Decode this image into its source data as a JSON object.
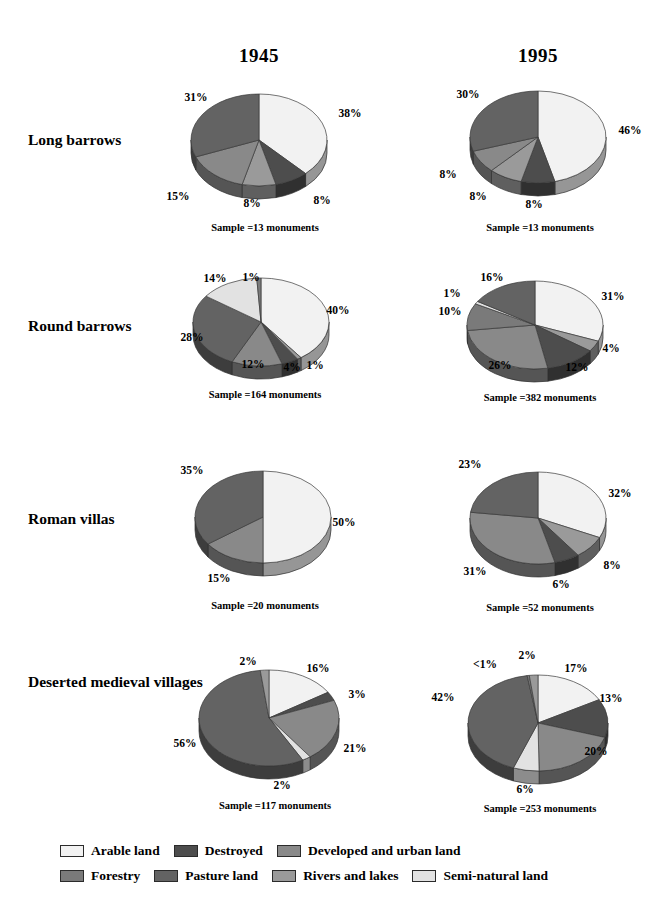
{
  "figure": {
    "columns": [
      {
        "id": "col-1945",
        "label": "1945"
      },
      {
        "id": "col-1995",
        "label": "1995"
      }
    ],
    "row_labels": [
      "Long barrows",
      "Round barrows",
      "Roman villas",
      "Deserted medieval villages"
    ]
  },
  "legend": {
    "position": "bottom",
    "rows": [
      [
        {
          "label": "Arable land",
          "color": "#f2f2f2"
        },
        {
          "label": "Destroyed",
          "color": "#4d4d4d"
        },
        {
          "label": "Developed and urban land",
          "color": "#898989"
        }
      ],
      [
        {
          "label": "Forestry",
          "color": "#7a7a7a"
        },
        {
          "label": "Pasture land",
          "color": "#636363"
        },
        {
          "label": "Rivers and lakes",
          "color": "#9a9a9a"
        },
        {
          "label": "Semi-natural land",
          "color": "#e2e2e2"
        }
      ]
    ]
  },
  "palette": {
    "arable": "#f2f2f2",
    "destroyed": "#4d4d4d",
    "developed": "#898989",
    "forestry": "#7a7a7a",
    "pasture": "#636363",
    "rivers": "#9a9a9a",
    "seminatural": "#e2e2e2"
  },
  "chart_data": [
    {
      "type": "pie",
      "id": "long-barrows-1945",
      "title": "Long barrows 1945",
      "row": "Long barrows",
      "column": "1945",
      "sample_label": "Sample =13 monuments",
      "sample_size": 13,
      "labels": [
        "Arable land",
        "Destroyed",
        "Developed and urban land",
        "Forestry",
        "Pasture land"
      ],
      "values": [
        38,
        8,
        8,
        15,
        31
      ],
      "value_labels": [
        "38%",
        "8%",
        "8%",
        "15%",
        "31%"
      ],
      "colors": [
        "#f2f2f2",
        "#4d4d4d",
        "#9a9a9a",
        "#898989",
        "#636363"
      ]
    },
    {
      "type": "pie",
      "id": "long-barrows-1995",
      "title": "Long barrows 1995",
      "row": "Long barrows",
      "column": "1995",
      "sample_label": "Sample =13 monuments",
      "sample_size": 13,
      "labels": [
        "Arable land",
        "Destroyed",
        "Developed and urban land",
        "Forestry",
        "Pasture land"
      ],
      "values": [
        46,
        8,
        8,
        8,
        30
      ],
      "value_labels": [
        "46%",
        "8%",
        "8%",
        "8%",
        "30%"
      ],
      "colors": [
        "#f2f2f2",
        "#4d4d4d",
        "#9a9a9a",
        "#898989",
        "#636363"
      ]
    },
    {
      "type": "pie",
      "id": "round-barrows-1945",
      "title": "Round barrows 1945",
      "row": "Round barrows",
      "column": "1945",
      "sample_label": "Sample =164 monuments",
      "sample_size": 164,
      "labels": [
        "Arable land",
        "Rivers and lakes",
        "Destroyed",
        "Developed and urban land",
        "Forestry",
        "Pasture land",
        "Semi-natural land",
        "Rivers and lakes"
      ],
      "values": [
        40,
        1,
        4,
        12,
        28,
        14,
        1
      ],
      "value_labels": [
        "40%",
        "1%",
        "4%",
        "12%",
        "28%",
        "14%",
        "1%"
      ],
      "colors": [
        "#f2f2f2",
        "#9a9a9a",
        "#4d4d4d",
        "#898989",
        "#636363",
        "#e2e2e2",
        "#7a7a7a"
      ]
    },
    {
      "type": "pie",
      "id": "round-barrows-1995",
      "title": "Round barrows 1995",
      "row": "Round barrows",
      "column": "1995",
      "sample_label": "Sample =382 monuments",
      "sample_size": 382,
      "labels": [
        "Arable land",
        "Rivers and lakes",
        "Destroyed",
        "Developed and urban land",
        "Forestry",
        "Semi-natural land",
        "Rivers and lakes",
        "Pasture land"
      ],
      "values": [
        31,
        4,
        12,
        26,
        10,
        1,
        16
      ],
      "value_labels": [
        "31%",
        "4%",
        "12%",
        "26%",
        "10%",
        "1%",
        "16%"
      ],
      "colors": [
        "#f2f2f2",
        "#9a9a9a",
        "#4d4d4d",
        "#898989",
        "#7a7a7a",
        "#e2e2e2",
        "#636363"
      ]
    },
    {
      "type": "pie",
      "id": "roman-villas-1945",
      "title": "Roman villas 1945",
      "row": "Roman villas",
      "column": "1945",
      "sample_label": "Sample =20 monuments",
      "sample_size": 20,
      "labels": [
        "Arable land",
        "Developed and urban land",
        "Pasture land"
      ],
      "values": [
        50,
        15,
        35
      ],
      "value_labels": [
        "50%",
        "15%",
        "35%"
      ],
      "colors": [
        "#f2f2f2",
        "#898989",
        "#636363"
      ]
    },
    {
      "type": "pie",
      "id": "roman-villas-1995",
      "title": "Roman villas 1995",
      "row": "Roman villas",
      "column": "1995",
      "sample_label": "Sample =52 monuments",
      "sample_size": 52,
      "labels": [
        "Arable land",
        "Rivers and lakes",
        "Destroyed",
        "Developed and urban land",
        "Pasture land",
        "Forestry"
      ],
      "values": [
        32,
        8,
        6,
        31,
        23
      ],
      "value_labels": [
        "32%",
        "8%",
        "6%",
        "31%",
        "23%"
      ],
      "colors": [
        "#f2f2f2",
        "#9a9a9a",
        "#4d4d4d",
        "#898989",
        "#636363"
      ]
    },
    {
      "type": "pie",
      "id": "dmv-1945",
      "title": "Deserted medieval villages 1945",
      "row": "Deserted medieval villages",
      "column": "1945",
      "sample_label": "Sample =117 monuments",
      "sample_size": 117,
      "labels": [
        "Arable land",
        "Destroyed",
        "Developed and urban land",
        "Rivers and lakes",
        "Pasture land",
        "Semi-natural land"
      ],
      "values": [
        16,
        3,
        21,
        2,
        56,
        2
      ],
      "value_labels": [
        "16%",
        "3%",
        "21%",
        "2%",
        "56%",
        "2%"
      ],
      "colors": [
        "#f2f2f2",
        "#4d4d4d",
        "#898989",
        "#e2e2e2",
        "#636363",
        "#9a9a9a"
      ]
    },
    {
      "type": "pie",
      "id": "dmv-1995",
      "title": "Deserted medieval villages 1995",
      "row": "Deserted medieval villages",
      "column": "1995",
      "sample_label": "Sample =253 monuments",
      "sample_size": 253,
      "labels": [
        "Arable land",
        "Destroyed",
        "Developed and urban land",
        "Rivers and lakes",
        "Pasture land",
        "Forestry",
        "Semi-natural land"
      ],
      "values": [
        17,
        13,
        20,
        6,
        42,
        0.5,
        2
      ],
      "value_labels": [
        "17%",
        "13%",
        "20%",
        "6%",
        "42%",
        "<1%",
        "2%"
      ],
      "colors": [
        "#f2f2f2",
        "#4d4d4d",
        "#898989",
        "#e2e2e2",
        "#636363",
        "#7a7a7a",
        "#9a9a9a"
      ]
    }
  ],
  "layout": {
    "pies": [
      {
        "id": "long-barrows-1945",
        "cx": 259,
        "cy": 140,
        "rx": 68,
        "ry": 46,
        "depth": 13,
        "start": -90,
        "label_pos": [
          [
            350,
            113
          ],
          [
            322,
            200
          ],
          [
            252,
            203
          ],
          [
            178,
            196
          ],
          [
            196,
            97
          ]
        ]
      },
      {
        "id": "long-barrows-1995",
        "cx": 538,
        "cy": 137,
        "rx": 68,
        "ry": 46,
        "depth": 13,
        "start": -90,
        "label_pos": [
          [
            630,
            130
          ],
          [
            534,
            204
          ],
          [
            478,
            196
          ],
          [
            448,
            174
          ],
          [
            468,
            94
          ]
        ]
      },
      {
        "id": "round-barrows-1945",
        "cx": 261,
        "cy": 322,
        "rx": 68,
        "ry": 44,
        "depth": 13,
        "start": -90,
        "label_pos": [
          [
            338,
            310
          ],
          [
            315,
            365
          ],
          [
            292,
            367
          ],
          [
            253,
            364
          ],
          [
            192,
            337
          ],
          [
            215,
            278
          ],
          [
            251,
            277
          ]
        ]
      },
      {
        "id": "round-barrows-1995",
        "cx": 535,
        "cy": 325,
        "rx": 68,
        "ry": 44,
        "depth": 13,
        "start": -90,
        "label_pos": [
          [
            613,
            296
          ],
          [
            611,
            348
          ],
          [
            577,
            367
          ],
          [
            500,
            365
          ],
          [
            450,
            311
          ],
          [
            452,
            293
          ],
          [
            492,
            277
          ]
        ]
      },
      {
        "id": "roman-villas-1945",
        "cx": 263,
        "cy": 517,
        "rx": 68,
        "ry": 46,
        "depth": 13,
        "start": -90,
        "label_pos": [
          [
            344,
            522
          ],
          [
            219,
            578
          ],
          [
            192,
            470
          ]
        ]
      },
      {
        "id": "roman-villas-1995",
        "cx": 538,
        "cy": 518,
        "rx": 68,
        "ry": 46,
        "depth": 13,
        "start": -90,
        "label_pos": [
          [
            620,
            493
          ],
          [
            612,
            565
          ],
          [
            561,
            584
          ],
          [
            475,
            571
          ],
          [
            470,
            464
          ]
        ]
      },
      {
        "id": "dmv-1945",
        "cx": 269,
        "cy": 718,
        "rx": 70,
        "ry": 48,
        "depth": 13,
        "start": -90,
        "label_pos": [
          [
            318,
            668
          ],
          [
            357,
            694
          ],
          [
            355,
            748
          ],
          [
            282,
            785
          ],
          [
            185,
            743
          ],
          [
            248,
            661
          ]
        ]
      },
      {
        "id": "dmv-1995",
        "cx": 538,
        "cy": 723,
        "rx": 70,
        "ry": 48,
        "depth": 13,
        "start": -90,
        "label_pos": [
          [
            576,
            668
          ],
          [
            611,
            698
          ],
          [
            596,
            751
          ],
          [
            525,
            789
          ],
          [
            443,
            697
          ],
          [
            485,
            664
          ],
          [
            527,
            655
          ]
        ]
      }
    ],
    "year_heads": [
      {
        "x": 199,
        "y": 45
      },
      {
        "x": 478,
        "y": 45
      }
    ],
    "rows": [
      {
        "label_x": 28,
        "label_y": 130
      },
      {
        "label_x": 28,
        "label_y": 316
      },
      {
        "label_x": 28,
        "label_y": 509
      },
      {
        "label_x": 28,
        "label_y": 672
      }
    ],
    "samples": [
      {
        "id": "long-barrows-1945",
        "x": 165,
        "y": 222
      },
      {
        "id": "long-barrows-1995",
        "x": 440,
        "y": 222
      },
      {
        "id": "round-barrows-1945",
        "x": 165,
        "y": 389
      },
      {
        "id": "round-barrows-1995",
        "x": 440,
        "y": 392
      },
      {
        "id": "roman-villas-1945",
        "x": 165,
        "y": 600
      },
      {
        "id": "roman-villas-1995",
        "x": 440,
        "y": 602
      },
      {
        "id": "dmv-1945",
        "x": 175,
        "y": 800
      },
      {
        "id": "dmv-1995",
        "x": 440,
        "y": 803
      }
    ]
  }
}
